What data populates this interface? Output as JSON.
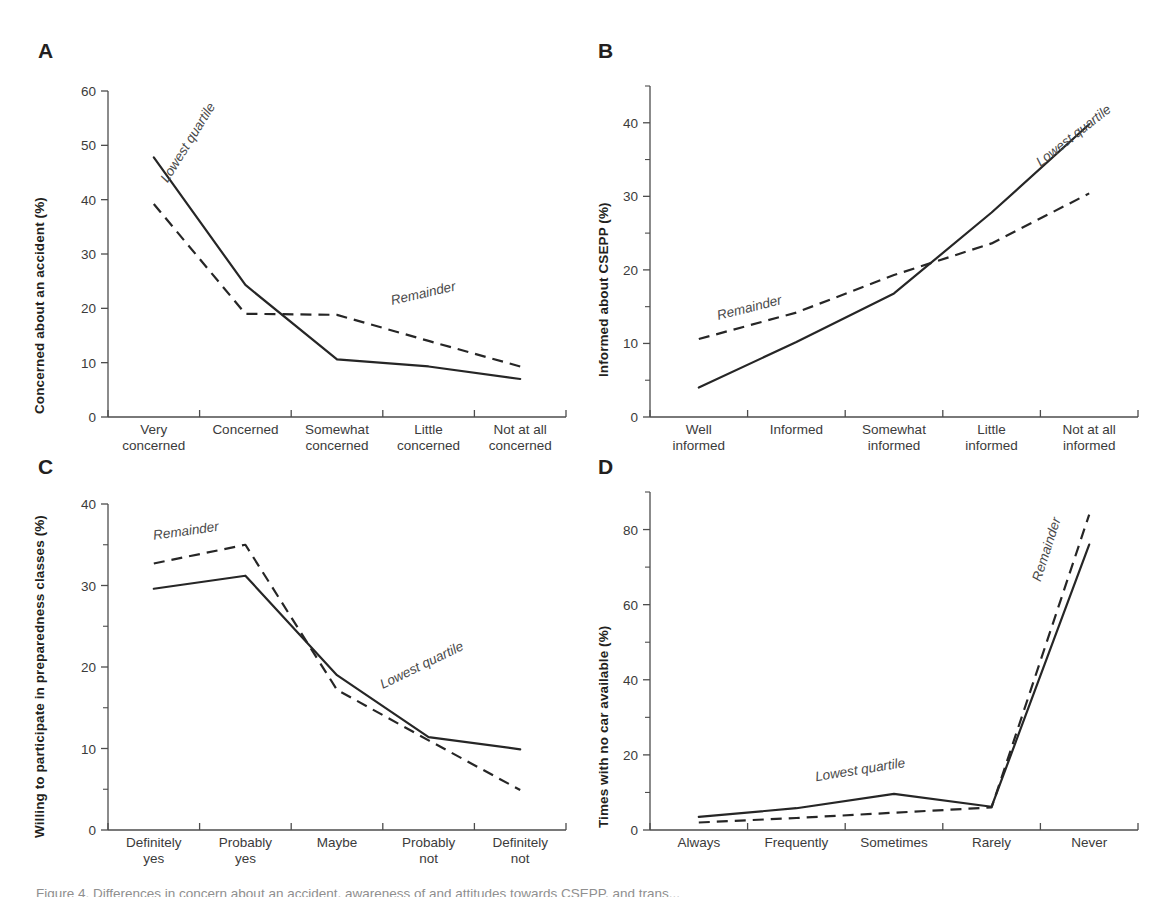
{
  "figure": {
    "caption": "Figure 4. Differences in concern about an accident, awareness of and attitudes towards CSEPP, and trans..."
  },
  "legend_terms": {
    "lowest_quartile": "Lowest quartile",
    "remainder": "Remainder"
  },
  "chart_data": [
    {
      "id": "A",
      "panel_letter": "A",
      "type": "line",
      "title": "",
      "xlabel": "",
      "ylabel": "Concerned about an accident (%)",
      "categories": [
        "Very\nconcerned",
        "Concerned",
        "Somewhat\nconcerned",
        "Little\nconcerned",
        "Not at all\nconcerned"
      ],
      "category_lines": [
        [
          "Very",
          "concerned"
        ],
        [
          "Concerned"
        ],
        [
          "Somewhat",
          "concerned"
        ],
        [
          "Little",
          "concerned"
        ],
        [
          "Not at all",
          "concerned"
        ]
      ],
      "ylim": [
        0,
        60
      ],
      "yticks": [
        0,
        10,
        20,
        30,
        40,
        50,
        60
      ],
      "ytick_labels": [
        "0",
        "10",
        "20",
        "30",
        "40",
        "50",
        "60"
      ],
      "yminor": [],
      "grid": false,
      "legend_position": "inline-annotations",
      "series": [
        {
          "name": "Lowest quartile",
          "style": "solid",
          "values": [
            47.8,
            24.3,
            10.6,
            9.3,
            7.0
          ],
          "label_x_frac": 0.13,
          "label_y": 43.0,
          "label_rotate": -58
        },
        {
          "name": "Remainder",
          "style": "dashed",
          "values": [
            39.2,
            19.0,
            18.8,
            14.0,
            9.3
          ],
          "label_x_frac": 0.62,
          "label_y": 20.6,
          "label_rotate": -13
        }
      ]
    },
    {
      "id": "B",
      "panel_letter": "B",
      "type": "line",
      "title": "",
      "xlabel": "",
      "ylabel": "Informed about CSEPP (%)",
      "categories": [
        "Well\ninformed",
        "Informed",
        "Somewhat\ninformed",
        "Little\ninformed",
        "Not at all\ninformed"
      ],
      "category_lines": [
        [
          "Well",
          "informed"
        ],
        [
          "Informed"
        ],
        [
          "Somewhat",
          "informed"
        ],
        [
          "Little",
          "informed"
        ],
        [
          "Not at all",
          "informed"
        ]
      ],
      "ylim": [
        0,
        45
      ],
      "yticks": [
        0,
        10,
        20,
        30,
        40
      ],
      "ytick_labels": [
        "0",
        "10",
        "20",
        "30",
        "40"
      ],
      "yminor": [
        5,
        15,
        25,
        35,
        45
      ],
      "grid": false,
      "legend_position": "inline-annotations",
      "series": [
        {
          "name": "Lowest quartile",
          "style": "solid",
          "values": [
            4.0,
            10.2,
            16.8,
            27.8,
            39.8
          ],
          "label_x_frac": 0.8,
          "label_y": 34.0,
          "label_rotate": -38
        },
        {
          "name": "Remainder",
          "style": "dashed",
          "values": [
            10.6,
            14.2,
            19.3,
            23.6,
            30.4
          ],
          "label_x_frac": 0.14,
          "label_y": 13.2,
          "label_rotate": -14
        }
      ]
    },
    {
      "id": "C",
      "panel_letter": "C",
      "type": "line",
      "title": "",
      "xlabel": "",
      "ylabel": "Willing to participate in preparedness classes (%)",
      "categories": [
        "Definitely\nyes",
        "Probably\nyes",
        "Maybe",
        "Probably\nnot",
        "Definitely\nnot"
      ],
      "category_lines": [
        [
          "Definitely",
          "yes"
        ],
        [
          "Probably",
          "yes"
        ],
        [
          "Maybe"
        ],
        [
          "Probably",
          "not"
        ],
        [
          "Definitely",
          "not"
        ]
      ],
      "ylim": [
        0,
        40
      ],
      "yticks": [
        0,
        10,
        20,
        30,
        40
      ],
      "ytick_labels": [
        "0",
        "10",
        "20",
        "30",
        "40"
      ],
      "yminor": [
        5,
        15,
        25,
        35
      ],
      "grid": false,
      "legend_position": "inline-annotations",
      "series": [
        {
          "name": "Lowest quartile",
          "style": "solid",
          "values": [
            29.6,
            31.2,
            19.0,
            11.4,
            9.9
          ],
          "label_x_frac": 0.6,
          "label_y": 17.3,
          "label_rotate": -26
        },
        {
          "name": "Remainder",
          "style": "dashed",
          "values": [
            32.7,
            35.0,
            17.2,
            11.0,
            4.9
          ],
          "label_x_frac": 0.1,
          "label_y": 35.6,
          "label_rotate": -8
        }
      ]
    },
    {
      "id": "D",
      "panel_letter": "D",
      "type": "line",
      "title": "",
      "xlabel": "",
      "ylabel": "Times with no car available (%)",
      "categories": [
        "Always",
        "Frequently",
        "Sometimes",
        "Rarely",
        "Never"
      ],
      "category_lines": [
        [
          "Always"
        ],
        [
          "Frequently"
        ],
        [
          "Sometimes"
        ],
        [
          "Rarely"
        ],
        [
          "Never"
        ]
      ],
      "ylim": [
        0,
        90
      ],
      "yticks": [
        0,
        20,
        40,
        60,
        80
      ],
      "ytick_labels": [
        "0",
        "20",
        "40",
        "60",
        "80"
      ],
      "yminor": [
        10,
        30,
        50,
        70,
        90
      ],
      "grid": false,
      "legend_position": "inline-annotations",
      "series": [
        {
          "name": "Lowest quartile",
          "style": "solid",
          "values": [
            3.5,
            5.8,
            9.6,
            6.2,
            76.0
          ],
          "label_x_frac": 0.34,
          "label_y": 13.0,
          "label_rotate": -9
        },
        {
          "name": "Remainder",
          "style": "dashed",
          "values": [
            2.0,
            3.2,
            4.6,
            6.0,
            84.0
          ],
          "label_x_frac": 0.8,
          "label_y": 66.0,
          "label_rotate": -72
        }
      ]
    }
  ]
}
